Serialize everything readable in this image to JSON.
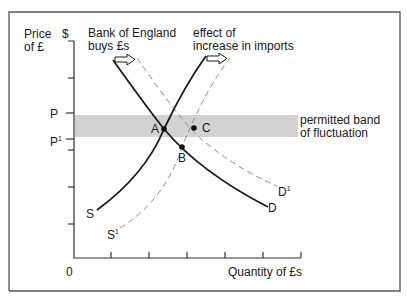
{
  "diagram": {
    "y_axis_label_line1": "Price",
    "y_axis_label_line2": "of £",
    "y_axis_unit": "$",
    "x_axis_label": "Quantity of £s",
    "origin_label": "0",
    "price_levels": [
      {
        "label": "P",
        "sup": ""
      },
      {
        "label": "P",
        "sup": "1"
      }
    ],
    "band_label_line1": "permitted band",
    "band_label_line2": "of fluctuation",
    "annotation_left_line1": "Bank of England",
    "annotation_left_line2": "buys £s",
    "annotation_right_line1": "effect of",
    "annotation_right_line2": "increase in imports",
    "curves": {
      "demand": {
        "label": "D",
        "sup": "",
        "style": "solid"
      },
      "demand_shifted": {
        "label": "D",
        "sup": "1",
        "style": "dashed"
      },
      "supply": {
        "label": "S",
        "sup": "",
        "style": "solid"
      },
      "supply_shifted": {
        "label": "S",
        "sup": "1",
        "style": "dashed"
      }
    },
    "points": [
      {
        "label": "A",
        "desc": "S meets D inside band"
      },
      {
        "label": "B",
        "desc": "S1 meets D below band"
      },
      {
        "label": "C",
        "desc": "S1 meets D1 inside band"
      }
    ],
    "colors": {
      "line": "#1a1a1a",
      "dashed": "#8a8a8a",
      "band": "#d2d2d2",
      "frame": "#555555"
    }
  }
}
